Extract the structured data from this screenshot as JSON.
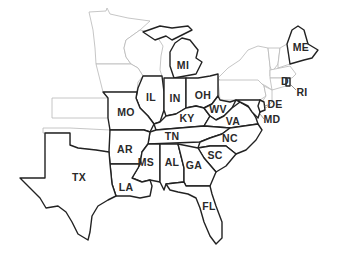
{
  "map": {
    "description": "Eastern United States outline map with highlighted states",
    "colors": {
      "background": "#ffffff",
      "highlighted_border": "#222222",
      "other_border": "#b8b8b8",
      "label": "#2a2a2a"
    },
    "labeled_states": [
      {
        "abbr": "ME",
        "x": 301,
        "y": 48
      },
      {
        "abbr": "MI",
        "x": 183,
        "y": 66
      },
      {
        "abbr": "IL",
        "x": 151,
        "y": 98
      },
      {
        "abbr": "IN",
        "x": 175,
        "y": 99
      },
      {
        "abbr": "OH",
        "x": 203,
        "y": 96
      },
      {
        "abbr": "D",
        "x": 285,
        "y": 82
      },
      {
        "abbr": "RI",
        "x": 302,
        "y": 93
      },
      {
        "abbr": "MO",
        "x": 126,
        "y": 113
      },
      {
        "abbr": "KY",
        "x": 187,
        "y": 119
      },
      {
        "abbr": "WV",
        "x": 218,
        "y": 110
      },
      {
        "abbr": "DE",
        "x": 275,
        "y": 105
      },
      {
        "abbr": "VA",
        "x": 233,
        "y": 122
      },
      {
        "abbr": "MD",
        "x": 272,
        "y": 120
      },
      {
        "abbr": "TN",
        "x": 172,
        "y": 137
      },
      {
        "abbr": "NC",
        "x": 230,
        "y": 139
      },
      {
        "abbr": "AR",
        "x": 125,
        "y": 150
      },
      {
        "abbr": "SC",
        "x": 215,
        "y": 156
      },
      {
        "abbr": "MS",
        "x": 146,
        "y": 163
      },
      {
        "abbr": "AL",
        "x": 172,
        "y": 163
      },
      {
        "abbr": "GA",
        "x": 194,
        "y": 166
      },
      {
        "abbr": "TX",
        "x": 79,
        "y": 178
      },
      {
        "abbr": "LA",
        "x": 126,
        "y": 188
      },
      {
        "abbr": "FL",
        "x": 209,
        "y": 207
      }
    ],
    "unlabeled_states": [
      "MN",
      "WI",
      "IA",
      "KS",
      "OK",
      "NY",
      "PA",
      "NJ",
      "VT",
      "NH",
      "MA",
      "CT"
    ]
  }
}
